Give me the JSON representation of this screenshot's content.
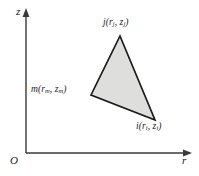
{
  "figure": {
    "kind": "axisymmetric-triangular-element",
    "background_color": "#ffffff",
    "line_color": "#1a1a1a",
    "axis_color": "#3a3a3a",
    "element_fill_color": "#dededd"
  },
  "axes": {
    "vertical": {
      "name": "z-axis",
      "label": "z",
      "x": 26,
      "y_top": 14,
      "y_bottom": 153
    },
    "horizontal": {
      "name": "r-axis",
      "label": "r",
      "y": 153,
      "x_left": 26,
      "x_right": 186
    },
    "origin": {
      "label": "O",
      "x": 26,
      "y": 153
    }
  },
  "element": {
    "name": "triangular-element",
    "fill": "#dededd",
    "outline": "#1a1a1a",
    "points": "120,36 155,120 91,95",
    "nodes": [
      {
        "id": "j",
        "letter": "j",
        "label": "j(r_j, z_j)",
        "coord_r": "r",
        "coord_r_sub": "j",
        "coord_z": "z",
        "coord_z_sub": "j",
        "x": 120,
        "y": 36
      },
      {
        "id": "m",
        "letter": "m",
        "label": "m(r_m, z_m)",
        "coord_r": "r",
        "coord_r_sub": "m",
        "coord_z": "z",
        "coord_z_sub": "m",
        "x": 91,
        "y": 95
      },
      {
        "id": "i",
        "letter": "i",
        "label": "i(r_i, z_i)",
        "coord_r": "r",
        "coord_r_sub": "i",
        "coord_z": "z",
        "coord_z_sub": "i",
        "x": 155,
        "y": 120
      }
    ]
  },
  "punctuation": {
    "open_paren": "(",
    "close_paren": ")",
    "comma": ", "
  }
}
